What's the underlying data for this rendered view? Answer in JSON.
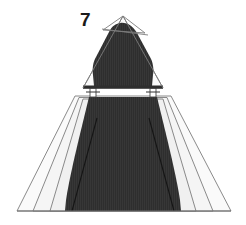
{
  "figure": {
    "label": "7",
    "label_position": {
      "x": 80,
      "y": 10
    },
    "canvas": {
      "width": 246,
      "height": 225,
      "background": "#ffffff"
    }
  },
  "colors": {
    "background": "#ffffff",
    "silhouette_fill": "#2e2e2e",
    "silhouette_stripe": "#3a3a3a",
    "wireframe_stroke": "#7d7d7d",
    "wireframe_fill_light": "#fafafa",
    "wireframe_fill_lighter": "#f3f3f3",
    "label_color": "#1a1a1a",
    "connector_fill": "#ffffff",
    "connector_stroke": "#555555"
  },
  "shapes": {
    "upper_triangle": {
      "name": "upper-outline-triangle",
      "points": "123,16 163,88 83,88",
      "fill": "#fafafa",
      "stroke": "#7d7d7d",
      "stroke_width": 1
    },
    "upper_inner_chord_a": {
      "name": "upper-inner-chord-a",
      "points": "123,16 144,32 103,30",
      "stroke": "#7d7d7d"
    },
    "upper_inner_chord_b": {
      "name": "upper-inner-chord-b",
      "x1": 103,
      "y1": 30,
      "x2": 147,
      "y2": 34
    },
    "upper_silhouette": {
      "name": "upper-dark-silhouette",
      "path": "M 120 23 C 127 22 133 26 137 33 L 150 57 C 153 62 154 68 153 74 L 151 86 L 94 86 L 92 74 C 91 68 92 62 95 57 L 109 32 C 112 26 115 24 120 23 Z",
      "fill": "#2e2e2e"
    },
    "upper_base_bar": {
      "name": "upper-base-bar",
      "x": 83,
      "y": 86,
      "width": 80,
      "height": 3,
      "fill": "#2e2e2e"
    },
    "left_connector": {
      "name": "left-connector-post",
      "x": 90,
      "y": 89,
      "width": 6,
      "height": 8
    },
    "right_connector": {
      "name": "right-connector-post",
      "x": 150,
      "y": 89,
      "width": 6,
      "height": 8
    },
    "lower_trapezoid_outer": {
      "name": "lower-outline-trapezoid-outer",
      "points": "75,96 171,96 231,211 17,211",
      "fill": "#fafafa",
      "stroke": "#7d7d7d"
    },
    "lower_trapezoid_mid": {
      "name": "lower-outline-trapezoid-mid",
      "points": "79,97 167,97 213,211 33,211",
      "stroke": "#7d7d7d"
    },
    "lower_trapezoid_inner": {
      "name": "lower-outline-trapezoid-inner",
      "points": "83,98 163,98 196,211 50,211",
      "stroke": "#7d7d7d"
    },
    "lower_silhouette": {
      "name": "lower-dark-silhouette",
      "path": "M 89 97 L 157 97 L 165 130 C 171 155 177 180 180 200 L 181 211 L 65 211 L 66 200 C 69 180 75 155 81 130 Z",
      "fill": "#2e2e2e"
    },
    "lower_fold_left": {
      "name": "lower-fold-line-left",
      "x1": 96,
      "y1": 120,
      "x2": 72,
      "y2": 211
    },
    "lower_fold_right": {
      "name": "lower-fold-line-right",
      "x1": 150,
      "y1": 120,
      "x2": 174,
      "y2": 211
    },
    "baseline": {
      "name": "figure-baseline",
      "x1": 17,
      "y1": 211,
      "x2": 231,
      "y2": 211
    }
  }
}
